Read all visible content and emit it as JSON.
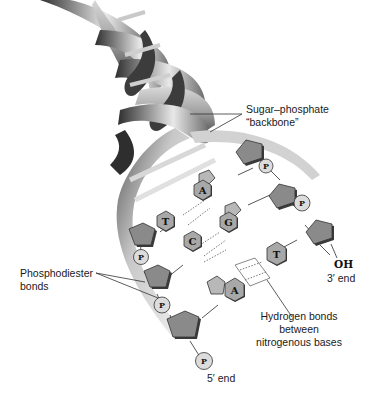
{
  "diagram": {
    "labels": {
      "backbone_line1": "Sugar–phosphate",
      "backbone_line2": "“backbone”",
      "phosphodiester_line1": "Phosphodiester",
      "phosphodiester_line2": "bonds",
      "hbond_line1": "Hydrogen bonds",
      "hbond_line2": "between",
      "hbond_line3": "nitrogenous bases",
      "oh": "OH",
      "three_prime": "3′ end",
      "five_prime": "5′ end"
    },
    "bases": {
      "top_left": "T",
      "top_right": "A",
      "mid_left": "C",
      "mid_right": "G",
      "low_left": "A",
      "low_right": "T"
    },
    "phosphate": "P",
    "colors": {
      "sugar": "#8a8a8a",
      "base": "#a8a8a8",
      "phosphate": "#dcdcdc",
      "helix_dark": "#3a3a3a",
      "helix_light": "#e6e6e6"
    }
  }
}
